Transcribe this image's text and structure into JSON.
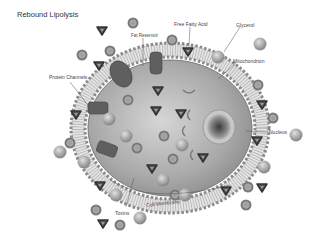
{
  "title": "Rebound Lipolysis",
  "labels": {
    "fat_reservoir": "Fat Reservoir",
    "free_fatty_acid": "Free Fatty Acid",
    "glycerol": "Glycerol",
    "mitochondrion": "Mitochondrion",
    "protein_channels": "Protein Channels",
    "nucleus": "Nucleus",
    "toxins": "Toxins",
    "cell_membrane": "Cell Membrane"
  },
  "colors": {
    "cytoplasm": "#a8a8a8",
    "membrane_head": "#8a8a8a",
    "channel": "#5a5a5a",
    "particle": "#8c8c8c",
    "triangle": "#4a4a4a"
  }
}
